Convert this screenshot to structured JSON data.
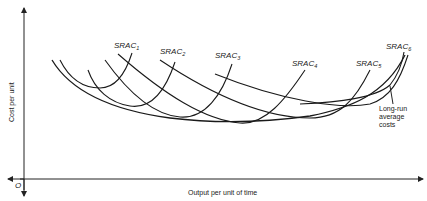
{
  "diagram": {
    "axes": {
      "y_label": "Cost per unit",
      "x_label": "Output per unit of time",
      "origin_label": "O"
    },
    "curves": [
      {
        "name": "SRAC",
        "subscript": "1"
      },
      {
        "name": "SRAC",
        "subscript": "2"
      },
      {
        "name": "SRAC",
        "subscript": "3"
      },
      {
        "name": "SRAC",
        "subscript": "4"
      },
      {
        "name": "SRAC",
        "subscript": "5"
      },
      {
        "name": "SRAC",
        "subscript": "6"
      }
    ],
    "envelope": {
      "label_line1": "Long-run",
      "label_line2": "average",
      "label_line3": "costs"
    },
    "colors": {
      "line": "#1a1a1a",
      "background": "#ffffff"
    }
  }
}
